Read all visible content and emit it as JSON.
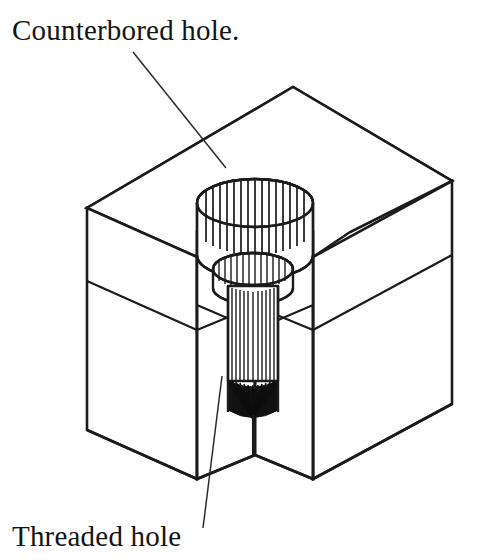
{
  "figure": {
    "title_annotation": "Counterbored hole.",
    "bottom_annotation": "Threaded hole",
    "background_color": "#ffffff",
    "line_color": "#1b1b1b",
    "text_color": "#141414"
  },
  "labels": {
    "counterbore": {
      "text": "Counterbored hole.",
      "x": 12,
      "y": 40
    },
    "threaded": {
      "text": "Threaded hole",
      "x": 12,
      "y": 546
    }
  },
  "leaders": {
    "counterbore_leader": {
      "from_x": 133,
      "from_y": 52,
      "to_x": 226,
      "to_y": 168
    },
    "threaded_leader": {
      "from_x": 222,
      "from_y": 376,
      "to_x": 203,
      "to_y": 528
    }
  },
  "block": {
    "top_apex_x": 293,
    "top_apex_y": 87,
    "left_corner_x": 87,
    "left_corner_y": 208,
    "right_corner_x": 452,
    "right_corner_y": 181,
    "left_bottom_y": 430,
    "right_bottom_y": 404,
    "front_notch_x": 255,
    "front_notch_top_y": 330,
    "front_notch_bottom_y": 455,
    "mid_band_label": "horizontal seam across the two front faces"
  },
  "counterbore": {
    "center_x": 255,
    "top_ellipse_cy": 203,
    "rx": 58,
    "ry": 24,
    "cylinder_bottom_cy": 255,
    "hatch_count": 17
  },
  "threaded_hole": {
    "center_x": 253,
    "top_ellipse_cy": 277,
    "rx": 40,
    "ry": 16,
    "shaft_half_width": 25,
    "shaft_top_y": 285,
    "shaft_bottom_y": 381,
    "cone_tip_y": 419,
    "cone_rays": 29,
    "hatch_count": 13
  }
}
